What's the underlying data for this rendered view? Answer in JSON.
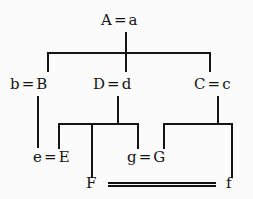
{
  "diagram": {
    "line_color": "#141414",
    "background_color": "#fbfbfb",
    "nodes": [
      {
        "id": "root",
        "label": "A = a",
        "generation": 1
      },
      {
        "id": "bB",
        "label": "b = B",
        "generation": 2
      },
      {
        "id": "Dd",
        "label": "D = d",
        "generation": 2
      },
      {
        "id": "Cc",
        "label": "C = c",
        "generation": 2
      },
      {
        "id": "eE",
        "label": "e = E",
        "generation": 3
      },
      {
        "id": "gG",
        "label": "g = G",
        "generation": 3
      },
      {
        "id": "F",
        "label": "F",
        "generation": 4
      },
      {
        "id": "f",
        "label": "f",
        "generation": 4
      }
    ]
  }
}
